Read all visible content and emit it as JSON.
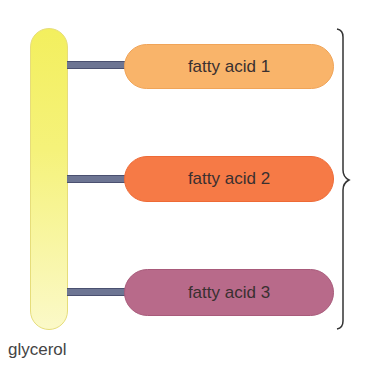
{
  "diagram": {
    "backbone": {
      "label": "glycerol",
      "color": "#f4f06a"
    },
    "fatty_acids": [
      {
        "label": "fatty acid 1",
        "color": "#f9b46a"
      },
      {
        "label": "fatty acid 2",
        "color": "#f67a46"
      },
      {
        "label": "fatty acid 3",
        "color": "#b86a8a"
      }
    ],
    "bond_color": "#6d7593"
  }
}
